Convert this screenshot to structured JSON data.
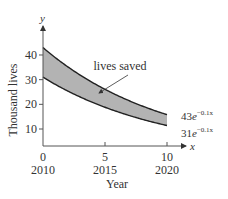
{
  "chart_data": {
    "type": "area",
    "title": "",
    "xlabel": "Year",
    "ylabel": "Thousand lives",
    "x_axis_var": "x",
    "y_axis_var": "y",
    "x_ticks": [
      {
        "value": 0,
        "label": "0",
        "sublabel": "2010"
      },
      {
        "value": 5,
        "label": "5",
        "sublabel": "2015"
      },
      {
        "value": 10,
        "label": "10",
        "sublabel": "2020"
      }
    ],
    "y_ticks": [
      10,
      20,
      30,
      40
    ],
    "xlim": [
      0,
      11
    ],
    "ylim": [
      3,
      48
    ],
    "series": [
      {
        "name": "43e^{-0.1x}",
        "label_base": "43",
        "label_exp": "−0.1x",
        "coef": 43,
        "rate": -0.1,
        "x": [
          0,
          1,
          2,
          3,
          4,
          5,
          6,
          7,
          8,
          9,
          10
        ],
        "values": [
          43.0,
          38.9,
          35.2,
          31.9,
          28.8,
          26.1,
          23.6,
          21.4,
          19.3,
          17.5,
          15.8
        ]
      },
      {
        "name": "31e^{-0.1x}",
        "label_base": "31",
        "label_exp": "−0.1x",
        "coef": 31,
        "rate": -0.1,
        "x": [
          0,
          1,
          2,
          3,
          4,
          5,
          6,
          7,
          8,
          9,
          10
        ],
        "values": [
          31.0,
          28.1,
          25.4,
          23.0,
          20.8,
          18.8,
          17.0,
          15.4,
          13.9,
          12.6,
          11.4
        ]
      }
    ],
    "shaded_region": {
      "between": [
        "43e^{-0.1x}",
        "31e^{-0.1x}"
      ],
      "x_range": [
        0,
        10
      ],
      "color": "#b3b3b3"
    },
    "annotations": [
      {
        "text": "lives saved",
        "arrow_to": {
          "x": 4,
          "y": 24
        }
      }
    ],
    "grid": false,
    "legend": null
  },
  "colors": {
    "fill": "#b3b3b3",
    "line": "#222222",
    "text": "#333333"
  }
}
